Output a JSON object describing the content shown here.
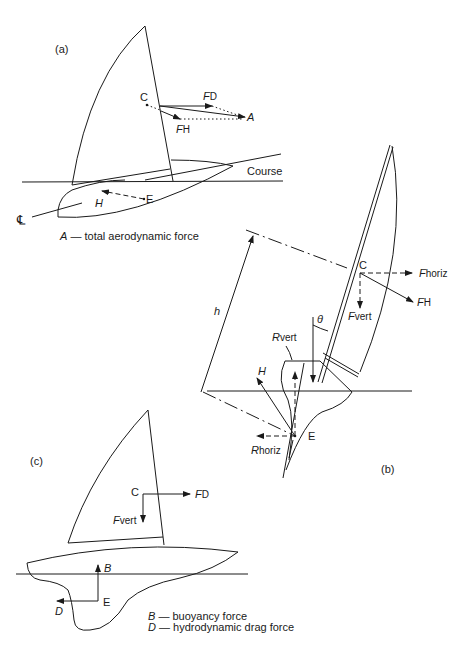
{
  "figure": {
    "panel_a": {
      "label": "(a)",
      "points": {
        "C": "C",
        "E": "E"
      },
      "forces": {
        "F": "F",
        "D_sub": "D",
        "H_sub": "H",
        "A": "A",
        "H": "H"
      },
      "course_label": "Course",
      "centerline_symbol": "℄",
      "caption": "A — total aerodynamic force",
      "caption_symbol": "A",
      "caption_text": " — total aerodynamic force"
    },
    "panel_b": {
      "label": "(b)",
      "points": {
        "C": "C",
        "E": "E"
      },
      "forces": {
        "F": "F",
        "horiz_sub": "horiz",
        "H_sub": "H",
        "vert_sub": "vert",
        "R": "R",
        "H": "H"
      },
      "height_label": "h",
      "angle_label": "θ"
    },
    "panel_c": {
      "label": "(c)",
      "points": {
        "C": "C",
        "E": "E"
      },
      "forces": {
        "F": "F",
        "D_sub": "D",
        "vert_sub": "vert",
        "B": "B",
        "D": "D"
      },
      "legend": [
        {
          "symbol": "B",
          "text": " — buoyancy force"
        },
        {
          "symbol": "D",
          "text": " — hydrodynamic drag force"
        }
      ]
    }
  }
}
